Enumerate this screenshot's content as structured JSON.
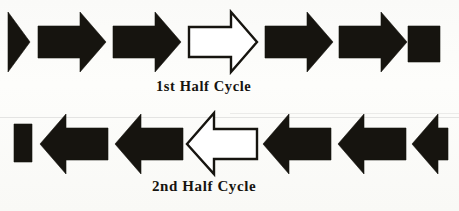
{
  "figure": {
    "background_color": "#fdfdfb",
    "ink_color": "#16140f",
    "width": 459,
    "height": 211
  },
  "rows": [
    {
      "name": "first-half-cycle-row",
      "direction": "right",
      "caption": "1st Half Cycle",
      "shapes": [
        {
          "name": "arrow-head-partial",
          "kind": "triangle-head",
          "fill": "solid"
        },
        {
          "name": "arrow-full-1",
          "kind": "full-arrow",
          "fill": "solid"
        },
        {
          "name": "arrow-full-2",
          "kind": "full-arrow",
          "fill": "solid"
        },
        {
          "name": "arrow-outline",
          "kind": "full-arrow",
          "fill": "outline"
        },
        {
          "name": "arrow-full-3",
          "kind": "full-arrow",
          "fill": "solid"
        },
        {
          "name": "arrow-full-4",
          "kind": "full-arrow",
          "fill": "solid"
        },
        {
          "name": "arrow-tail-partial",
          "kind": "tail-block",
          "fill": "solid"
        }
      ]
    },
    {
      "name": "second-half-cycle-row",
      "direction": "left",
      "caption": "2nd Half Cycle",
      "shapes": [
        {
          "name": "arrow-tail-partial",
          "kind": "tail-block",
          "fill": "solid"
        },
        {
          "name": "arrow-full-1",
          "kind": "full-arrow",
          "fill": "solid"
        },
        {
          "name": "arrow-full-2",
          "kind": "full-arrow",
          "fill": "solid"
        },
        {
          "name": "arrow-outline",
          "kind": "full-arrow",
          "fill": "outline"
        },
        {
          "name": "arrow-full-3",
          "kind": "full-arrow",
          "fill": "solid"
        },
        {
          "name": "arrow-full-4",
          "kind": "full-arrow",
          "fill": "solid"
        },
        {
          "name": "arrow-head-partial",
          "kind": "head-with-stub",
          "fill": "solid"
        }
      ]
    }
  ],
  "captions": {
    "first": "1st Half Cycle",
    "second": "2nd Half Cycle"
  }
}
